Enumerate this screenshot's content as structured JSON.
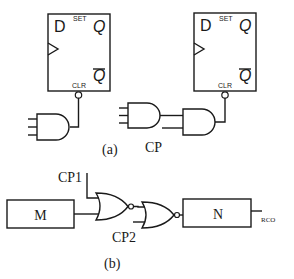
{
  "diagram_a": {
    "caption": "(a)",
    "flipflop_left": {
      "d_label": "D",
      "set_label": "SET",
      "q_label": "Q",
      "qbar_label": "Q",
      "clr_label": "CLR"
    },
    "flipflop_right": {
      "d_label": "D",
      "set_label": "SET",
      "q_label": "Q",
      "qbar_label": "Q",
      "clr_label": "CLR"
    },
    "cp_label": "CP"
  },
  "diagram_b": {
    "caption": "(b)",
    "block_m": "M",
    "block_n": "N",
    "cp1_label": "CP1",
    "cp2_label": "CP2",
    "rco_label": "RCO"
  },
  "colors": {
    "stroke": "#1a1a1a",
    "background": "#ffffff"
  }
}
